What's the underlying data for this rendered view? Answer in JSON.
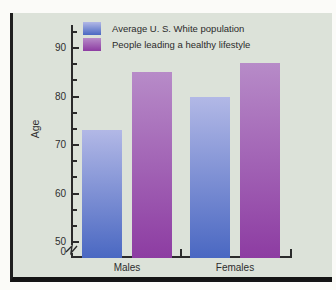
{
  "figure": {
    "panel_background_color": "#dce2d9",
    "frame_color": "#1a1a1a",
    "text_color": "#2e2e2e"
  },
  "chart_data": {
    "type": "bar",
    "title": "",
    "xlabel": "",
    "ylabel": "Age",
    "categories": [
      "Males",
      "Females"
    ],
    "series": [
      {
        "name": "Average U. S. White population",
        "values": [
          73,
          80
        ],
        "color_top": "#b2b8e6",
        "color_bottom": "#4a68c2"
      },
      {
        "name": "People leading a healthy lifestyle",
        "values": [
          85,
          87
        ],
        "color_top": "#b78bc8",
        "color_bottom": "#8d3ca2"
      }
    ],
    "y_axis": {
      "major_ticks": [
        90,
        80,
        70,
        60,
        50
      ],
      "minor_ticks_between_majors": 2,
      "zero_label": "0",
      "axis_break": true,
      "value_range_shown": [
        50,
        95
      ]
    },
    "legend_position": "top-left-inside",
    "grid": false
  }
}
